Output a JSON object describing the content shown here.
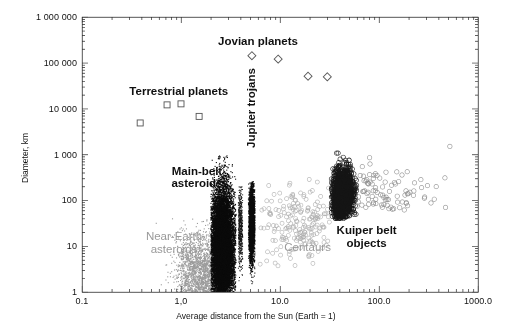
{
  "figure": {
    "width": 512,
    "height": 326,
    "background": "#ffffff",
    "frame_color": "#2b2b2b"
  },
  "plot_area": {
    "left": 82,
    "top": 17,
    "right": 478,
    "bottom": 292
  },
  "axes": {
    "x": {
      "title": "Average distance from the Sun (Earth = 1)",
      "scale": "log",
      "min": 0.1,
      "max": 1000,
      "tick_values": [
        0.1,
        1.0,
        10.0,
        100.0,
        1000.0
      ],
      "tick_labels": [
        "0.1",
        "1,0",
        "10.0",
        "100.0",
        "1000.0"
      ],
      "minor_ticks": true
    },
    "y": {
      "title": "Diameter, km",
      "scale": "log",
      "min": 1,
      "max": 1000000,
      "tick_values": [
        1,
        10,
        100,
        1000,
        10000,
        100000,
        1000000
      ],
      "tick_labels": [
        "1",
        "10",
        "100",
        "1 000",
        "10 000",
        "100 000",
        "1 000 000"
      ],
      "minor_ticks": true
    }
  },
  "annotations": [
    {
      "name": "jovian-planets-label",
      "text": "Jovian planets",
      "x": 6.0,
      "y": 400000,
      "style": "bold",
      "rotated": false
    },
    {
      "name": "terrestrial-planets-label",
      "text": "Terrestrial planets",
      "x": 0.95,
      "y": 33000,
      "style": "bold",
      "rotated": false
    },
    {
      "name": "main-belt-asteroids-label",
      "text": "Main-belt\nasteroids",
      "x": 1.45,
      "y": 600,
      "style": "bold",
      "rotated": false
    },
    {
      "name": "jupiter-trojans-label",
      "text": "Jupiter trojans",
      "x": 4.4,
      "y": 1400,
      "style": "bold",
      "rotated": true
    },
    {
      "name": "near-earth-asteroids-label",
      "text": "Near-Earth\nasteroids",
      "x": 0.85,
      "y": 22,
      "style": "faint",
      "rotated": false
    },
    {
      "name": "centaurs-label",
      "text": "Centaurs",
      "x": 19.0,
      "y": 13,
      "style": "faint",
      "rotated": false
    },
    {
      "name": "kuiper-belt-objects-label",
      "text": "Kuiper belt\nobjects",
      "x": 75.0,
      "y": 30,
      "style": "bold",
      "rotated": false
    }
  ],
  "chart_data": {
    "type": "scatter",
    "title": "",
    "xlabel": "Average distance from the Sun (Earth = 1)",
    "ylabel": "Diameter, km",
    "xscale": "log",
    "yscale": "log",
    "xlim": [
      0.1,
      1000
    ],
    "ylim": [
      1,
      1000000
    ],
    "grid": false,
    "legend": "none (in-plot text annotations)",
    "series": [
      {
        "name": "Jovian planets",
        "marker": "diamond-open",
        "color": "#555555",
        "size": 7,
        "points": [
          {
            "label": "Jupiter",
            "x": 5.2,
            "y": 142984
          },
          {
            "label": "Saturn",
            "x": 9.58,
            "y": 120536
          },
          {
            "label": "Uranus",
            "x": 19.2,
            "y": 51118
          },
          {
            "label": "Neptune",
            "x": 30.05,
            "y": 49528
          }
        ]
      },
      {
        "name": "Terrestrial planets",
        "marker": "square-open",
        "color": "#555555",
        "size": 6,
        "points": [
          {
            "label": "Mercury",
            "x": 0.387,
            "y": 4879
          },
          {
            "label": "Venus",
            "x": 0.723,
            "y": 12104
          },
          {
            "label": "Earth",
            "x": 1.0,
            "y": 12742
          },
          {
            "label": "Mars",
            "x": 1.524,
            "y": 6779
          }
        ]
      },
      {
        "name": "Near-Earth asteroids",
        "marker": "dot",
        "color": "#9c9c9c",
        "size": 1.1,
        "count": 2600,
        "distribution": {
          "x_log_mean": 0.21,
          "x_log_sigma": 0.13,
          "y_log_mean": 0.35,
          "y_log_sigma": 0.45,
          "x_range": [
            0.55,
            2.6
          ],
          "y_range": [
            1,
            40
          ]
        }
      },
      {
        "name": "Main-belt asteroids",
        "marker": "dot",
        "color": "#0b0b0b",
        "size": 1.1,
        "count": 16000,
        "distribution": {
          "x_log_mean": 0.42,
          "x_log_sigma": 0.055,
          "y_log_mean": 0.95,
          "y_log_sigma": 0.62,
          "x_range": [
            2.0,
            3.6
          ],
          "y_range": [
            1,
            950
          ]
        }
      },
      {
        "name": "Jupiter trojans",
        "marker": "dot",
        "color": "#0b0b0b",
        "size": 1.1,
        "count": 3000,
        "distribution": {
          "x_log_mean": 0.716,
          "x_log_sigma": 0.016,
          "y_log_mean": 1.5,
          "y_log_sigma": 0.42,
          "x_range": [
            4.8,
            5.6
          ],
          "y_range": [
            1.5,
            260
          ]
        }
      },
      {
        "name": "Hildas group",
        "marker": "dot",
        "color": "#1a1a1a",
        "size": 1.0,
        "count": 700,
        "distribution": {
          "x_log_mean": 0.6,
          "x_log_sigma": 0.018,
          "y_log_mean": 1.4,
          "y_log_sigma": 0.4,
          "x_range": [
            3.8,
            4.2
          ],
          "y_range": [
            1.5,
            200
          ]
        }
      },
      {
        "name": "Centaurs",
        "marker": "circle-open",
        "color": "#b0b0b0",
        "size": 2.0,
        "count": 230,
        "distribution": {
          "x_log_mean": 1.18,
          "x_log_sigma": 0.2,
          "y_log_mean": 1.55,
          "y_log_sigma": 0.45,
          "x_range": [
            6,
            32
          ],
          "y_range": [
            3,
            320
          ]
        }
      },
      {
        "name": "Kuiper belt objects",
        "marker": "circle-open",
        "color": "#161616",
        "size": 2.2,
        "count": 1500,
        "distribution": {
          "x_log_mean": 1.63,
          "x_log_sigma": 0.055,
          "y_log_mean": 2.12,
          "y_log_sigma": 0.3,
          "x_range": [
            33,
            60
          ],
          "y_range": [
            40,
            2400
          ]
        }
      },
      {
        "name": "Scattered disc / distant objects",
        "marker": "circle-open",
        "color": "#8e8e8e",
        "size": 2.2,
        "count": 120,
        "distribution": {
          "x_log_mean": 1.95,
          "x_log_sigma": 0.28,
          "y_log_mean": 2.2,
          "y_log_sigma": 0.3,
          "x_range": [
            60,
            600
          ],
          "y_range": [
            60,
            1600
          ]
        }
      }
    ],
    "notable_far_points": [
      {
        "label": "distant object",
        "x": 520,
        "y": 1500
      },
      {
        "label": "distant object",
        "x": 470,
        "y": 70
      }
    ]
  }
}
